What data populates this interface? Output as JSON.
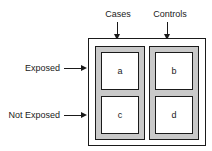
{
  "diagram": {
    "type": "case-control-2x2-contingency-table",
    "column_headers": [
      {
        "id": "cases",
        "label": "Cases",
        "arrow": "down-arrow-icon"
      },
      {
        "id": "controls",
        "label": "Controls",
        "arrow": "down-arrow-icon"
      }
    ],
    "row_headers": [
      {
        "id": "exposed",
        "label": "Exposed",
        "arrow": "right-arrow-icon"
      },
      {
        "id": "not_exposed",
        "label": "Not Exposed",
        "arrow": "right-arrow-icon"
      }
    ],
    "cells": [
      {
        "id": "cell-a",
        "label": "a",
        "row": "exposed",
        "column": "cases"
      },
      {
        "id": "cell-b",
        "label": "b",
        "row": "exposed",
        "column": "controls"
      },
      {
        "id": "cell-c",
        "label": "c",
        "row": "not_exposed",
        "column": "cases"
      },
      {
        "id": "cell-d",
        "label": "d",
        "row": "not_exposed",
        "column": "controls"
      }
    ],
    "colors": {
      "outline": "#1a1a1a",
      "column_fill": "#c9c9c9",
      "cell_fill": "#ffffff",
      "background": "#ffffff",
      "text": "#1a1a1a"
    }
  }
}
